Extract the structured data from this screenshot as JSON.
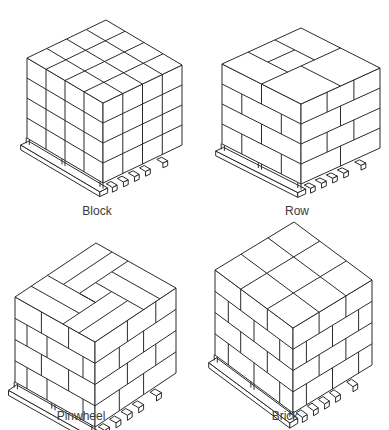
{
  "figure": {
    "patterns": [
      {
        "id": "block",
        "label": "Block",
        "label_pos": [
          97,
          212
        ]
      },
      {
        "id": "row",
        "label": "Row",
        "label_pos": [
          297,
          212
        ]
      },
      {
        "id": "pinwheel",
        "label": "Pinwheel",
        "label_pos": [
          81,
          416
        ]
      },
      {
        "id": "brick",
        "label": "Brick",
        "label_pos": [
          285,
          416
        ]
      }
    ]
  },
  "colors": {
    "line": "#2a2a2a",
    "background": "#ffffff",
    "label": "#3a3a3a"
  }
}
